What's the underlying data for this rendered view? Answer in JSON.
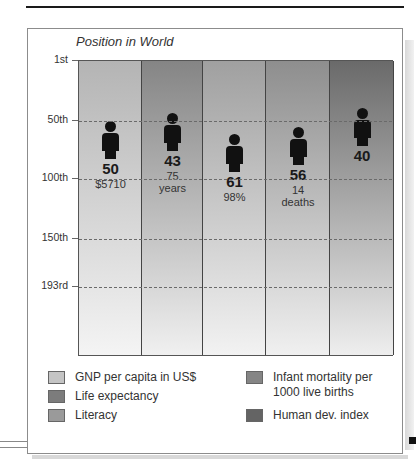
{
  "chart_data": {
    "type": "bar",
    "title": "Position in World",
    "xlabel": "",
    "ylabel": "",
    "y_axis": {
      "inverted": true,
      "ticks": [
        "1st",
        "50th",
        "100th",
        "150th",
        "193rd"
      ],
      "tick_values": [
        1,
        50,
        100,
        150,
        193
      ],
      "range": [
        1,
        193
      ]
    },
    "grid": "dashed horizontal at 50th, 100th, 150th, 193rd",
    "categories": [
      "GNP per capita in US$",
      "Life expectancy",
      "Literacy",
      "Infant mortality per 1000 live births",
      "Human dev. index"
    ],
    "series": [
      {
        "name": "Position in World",
        "values": [
          50,
          43,
          61,
          56,
          40
        ],
        "value_labels": [
          "$5710",
          "75 years",
          "98%",
          "14 deaths",
          ""
        ]
      }
    ],
    "legend_position": "bottom"
  },
  "chart": {
    "title": "Position in World",
    "ticks": [
      {
        "label": "1st",
        "y": 0
      },
      {
        "label": "50th",
        "y": 60
      },
      {
        "label": "100th",
        "y": 118
      },
      {
        "label": "150th",
        "y": 178
      },
      {
        "label": "193rd",
        "y": 226
      }
    ],
    "columns": [
      {
        "rank": "50",
        "line1": "$5710",
        "line2": "",
        "color_top": "#b4b4b4",
        "color_bottom": "#f4f4f4",
        "fig_top": 60
      },
      {
        "rank": "43",
        "line1": "75",
        "line2": "years",
        "color_top": "#858585",
        "color_bottom": "#f0f0f0",
        "fig_top": 52
      },
      {
        "rank": "61",
        "line1": "98%",
        "line2": "",
        "color_top": "#a0a0a0",
        "color_bottom": "#f2f2f2",
        "fig_top": 73
      },
      {
        "rank": "56",
        "line1": "14",
        "line2": "deaths",
        "color_top": "#8e8e8e",
        "color_bottom": "#f0f0f0",
        "fig_top": 66
      },
      {
        "rank": "40",
        "line1": "",
        "line2": "",
        "color_top": "#6a6a6a",
        "color_bottom": "#eeeeee",
        "fig_top": 47
      }
    ]
  },
  "legend": {
    "items": [
      {
        "label": "GNP per capita in US$",
        "color": "#c4c4c4"
      },
      {
        "label": "Life expectancy",
        "color": "#7c7c7c"
      },
      {
        "label": "Literacy",
        "color": "#9a9a9a"
      },
      {
        "label": "Infant mortality per 1000 live births",
        "line1": "Infant mortality per",
        "line2": "1000 live births",
        "color": "#858585"
      },
      {
        "label": "Human dev. index",
        "color": "#646464"
      }
    ]
  }
}
